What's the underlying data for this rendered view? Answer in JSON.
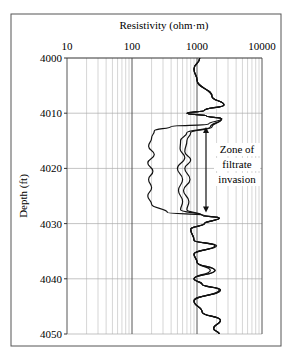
{
  "chart_data": {
    "type": "line",
    "title": "Resistivity (ohm·m)",
    "xlabel": "Resistivity (ohm·m)",
    "ylabel": "Depth (ft)",
    "xscale": "log",
    "xlim": [
      10,
      10000
    ],
    "ylim": [
      4000,
      4050
    ],
    "y_inverted": true,
    "x_ticks": [
      "10",
      "100",
      "1000",
      "10000"
    ],
    "y_ticks": [
      "4000",
      "4010",
      "4020",
      "4030",
      "4040",
      "4050"
    ],
    "grid": true,
    "legend": null,
    "annotation": {
      "text_lines": [
        "Zone of",
        "filtrate",
        "invasion"
      ],
      "arrow": {
        "x": 1250,
        "depth_from": 4012.5,
        "depth_to": 4028,
        "double_headed": true
      }
    },
    "series": [
      {
        "name": "Deep resistivity",
        "points": [
          [
            1100,
            4000
          ],
          [
            900,
            4002
          ],
          [
            1000,
            4004
          ],
          [
            1700,
            4007
          ],
          [
            2600,
            4008.5
          ],
          [
            1300,
            4009.5
          ],
          [
            700,
            4010
          ],
          [
            1400,
            4010.5
          ],
          [
            2400,
            4011
          ],
          [
            1700,
            4012.5
          ],
          [
            800,
            4013.5
          ],
          [
            700,
            4015
          ],
          [
            650,
            4017
          ],
          [
            800,
            4018.5
          ],
          [
            650,
            4020
          ],
          [
            780,
            4022
          ],
          [
            620,
            4024
          ],
          [
            750,
            4026
          ],
          [
            700,
            4027.5
          ],
          [
            1200,
            4028.5
          ],
          [
            2200,
            4029
          ],
          [
            1300,
            4030
          ],
          [
            800,
            4031
          ],
          [
            900,
            4033
          ],
          [
            1900,
            4034
          ],
          [
            900,
            4035.5
          ],
          [
            1000,
            4037
          ],
          [
            1900,
            4038.5
          ],
          [
            900,
            4040
          ],
          [
            1200,
            4041
          ],
          [
            2300,
            4042
          ],
          [
            900,
            4044
          ],
          [
            1200,
            4046
          ],
          [
            2300,
            4047.5
          ],
          [
            1800,
            4049
          ],
          [
            2200,
            4050
          ]
        ]
      },
      {
        "name": "Medium resistivity",
        "points": [
          [
            1100,
            4000
          ],
          [
            900,
            4002
          ],
          [
            1000,
            4004
          ],
          [
            1700,
            4007
          ],
          [
            2600,
            4008.5
          ],
          [
            1300,
            4009.5
          ],
          [
            700,
            4010
          ],
          [
            1400,
            4010.5
          ],
          [
            2400,
            4011
          ],
          [
            1600,
            4012.5
          ],
          [
            700,
            4013.5
          ],
          [
            560,
            4015
          ],
          [
            550,
            4016.5
          ],
          [
            650,
            4018
          ],
          [
            500,
            4020
          ],
          [
            600,
            4022
          ],
          [
            520,
            4024
          ],
          [
            600,
            4026
          ],
          [
            560,
            4027.5
          ],
          [
            1200,
            4028.5
          ],
          [
            2200,
            4029
          ],
          [
            1300,
            4030
          ],
          [
            800,
            4031
          ],
          [
            900,
            4033
          ],
          [
            2000,
            4034
          ],
          [
            900,
            4035.5
          ],
          [
            1000,
            4037
          ],
          [
            1600,
            4038.5
          ],
          [
            900,
            4040
          ],
          [
            1200,
            4041
          ],
          [
            2200,
            4042
          ],
          [
            900,
            4044
          ],
          [
            1200,
            4046
          ],
          [
            2300,
            4047.5
          ],
          [
            1800,
            4049
          ],
          [
            2200,
            4050
          ]
        ]
      },
      {
        "name": "Shallow resistivity",
        "points": [
          [
            1100,
            4000
          ],
          [
            900,
            4002
          ],
          [
            1000,
            4004
          ],
          [
            1700,
            4007
          ],
          [
            2600,
            4008.5
          ],
          [
            1300,
            4009.5
          ],
          [
            700,
            4010
          ],
          [
            1400,
            4010.5
          ],
          [
            2400,
            4011
          ],
          [
            1500,
            4012
          ],
          [
            400,
            4012.4
          ],
          [
            220,
            4013.2
          ],
          [
            200,
            4014.5
          ],
          [
            180,
            4016
          ],
          [
            220,
            4017.5
          ],
          [
            175,
            4019
          ],
          [
            210,
            4020.5
          ],
          [
            180,
            4022
          ],
          [
            200,
            4023.5
          ],
          [
            175,
            4025
          ],
          [
            200,
            4026.5
          ],
          [
            350,
            4028
          ],
          [
            1300,
            4028.5
          ],
          [
            2200,
            4029
          ],
          [
            1300,
            4030
          ],
          [
            800,
            4031
          ],
          [
            900,
            4033
          ],
          [
            1900,
            4034
          ],
          [
            900,
            4035.5
          ],
          [
            1000,
            4037
          ],
          [
            1900,
            4038.5
          ],
          [
            900,
            4040
          ],
          [
            1200,
            4041
          ],
          [
            2300,
            4042
          ],
          [
            900,
            4044
          ],
          [
            1200,
            4046
          ],
          [
            2300,
            4047.5
          ],
          [
            1800,
            4049
          ],
          [
            2200,
            4050
          ]
        ]
      }
    ]
  },
  "labels": {
    "title": "Resistivity (ohm·m)",
    "ylabel": "Depth (ft)",
    "annotation": [
      "Zone of",
      "filtrate",
      "invasion"
    ],
    "caption_partial": "Figure caption (cut off)"
  }
}
